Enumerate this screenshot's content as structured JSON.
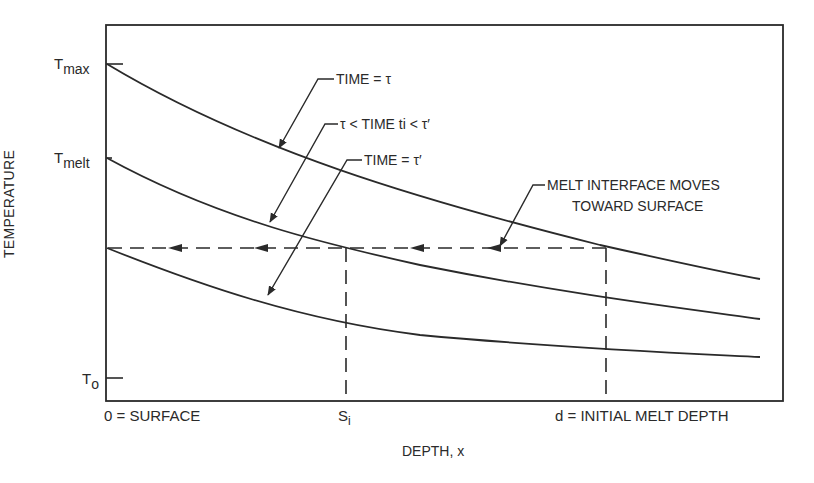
{
  "diagram": {
    "title": "",
    "y_axis_label": "TEMPERATURE",
    "x_axis_label": "DEPTH, x",
    "y_ticks": {
      "t_max": {
        "main": "T",
        "sub": "max"
      },
      "t_melt": {
        "main": "T",
        "sub": "melt"
      },
      "t_o": {
        "main": "T",
        "sub": "o"
      }
    },
    "x_ticks": {
      "surface": "0 = SURFACE",
      "s_i": {
        "main": "S",
        "sub": "i"
      },
      "d": "d = INITIAL MELT DEPTH"
    },
    "curves": [
      {
        "name": "time-tau",
        "label": "TIME = τ"
      },
      {
        "name": "time-between",
        "label": "τ < TIME ti < τ′"
      },
      {
        "name": "time-tau-prime",
        "label": "TIME = τ′"
      }
    ],
    "annotation": {
      "line1": "MELT INTERFACE MOVES",
      "line2": "TOWARD SURFACE"
    },
    "colors": {
      "line": "#2a2a2a",
      "background": "#ffffff"
    }
  }
}
